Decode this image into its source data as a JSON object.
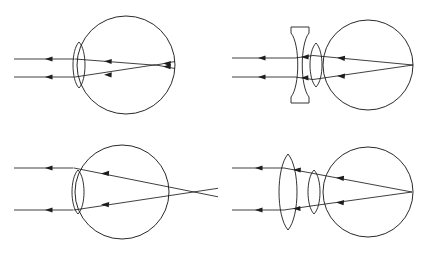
{
  "figure": {
    "background_color": "#ffffff",
    "stroke_color": "#1d1d1d",
    "width": 438,
    "height": 257,
    "panel_count": 4,
    "panel_layout": "2x2 grid"
  },
  "panels": [
    {
      "id": "panel-top-left",
      "position": "top-left",
      "name": "myopia-uncorrected",
      "condition": "Myopia (nearsighted), uncorrected",
      "spectacle_lens": "none",
      "focus_location": "in front of retina",
      "ray_count": 2,
      "eye": {
        "globe_center_x": 126,
        "globe_center_y": 65,
        "globe_radius": 49,
        "lens_center_x": 79,
        "lens_center_y": 65,
        "lens_half_height": 23,
        "lens_half_width": 7,
        "cornea_apex_x": 70
      },
      "rays": {
        "entry_x": 14,
        "upper_y": 59,
        "lower_y": 77,
        "arrow_x": 48,
        "crossing_x": 155,
        "crossing_y": 65,
        "terminus_x": 175
      }
    },
    {
      "id": "panel-top-right",
      "position": "top-right",
      "name": "myopia-corrected",
      "condition": "Myopia corrected by a diverging (biconcave) lens",
      "spectacle_lens": "biconcave",
      "focus_location": "on the retina",
      "ray_count": 2,
      "eye": {
        "globe_center_x": 368,
        "globe_center_y": 65,
        "globe_radius": 45,
        "lens_center_x": 316,
        "lens_center_y": 65,
        "lens_half_height": 22,
        "lens_half_width": 7,
        "cornea_apex_x": 307
      },
      "spec": {
        "center_x": 300,
        "center_y": 65,
        "half_height": 38,
        "waist_half_width": 4,
        "rim_half_width": 9
      },
      "rays": {
        "entry_x": 232,
        "upper_y": 58,
        "lower_y": 77,
        "arrow_x": 264,
        "focus_x": 413,
        "focus_y": 65
      }
    },
    {
      "id": "panel-bottom-left",
      "position": "bottom-left",
      "name": "hyperopia-uncorrected",
      "condition": "Hyperopia (farsighted), uncorrected",
      "spectacle_lens": "none",
      "focus_location": "behind the retina",
      "ray_count": 2,
      "eye": {
        "globe_center_x": 122,
        "globe_center_y": 192,
        "globe_radius": 47,
        "lens_center_x": 78,
        "lens_center_y": 192,
        "lens_half_height": 22,
        "lens_half_width": 7,
        "cornea_apex_x": 69
      },
      "rays": {
        "entry_x": 14,
        "upper_y": 168,
        "lower_y": 210,
        "arrow_x": 48,
        "crossing_x": 196,
        "crossing_y": 192,
        "terminus_x": 218
      }
    },
    {
      "id": "panel-bottom-right",
      "position": "bottom-right",
      "name": "hyperopia-corrected",
      "condition": "Hyperopia corrected by a converging (biconvex) lens",
      "spectacle_lens": "biconvex",
      "focus_location": "on the retina",
      "ray_count": 2,
      "eye": {
        "globe_center_x": 368,
        "globe_center_y": 192,
        "globe_radius": 45,
        "lens_center_x": 314,
        "lens_center_y": 192,
        "lens_half_height": 22,
        "lens_half_width": 7,
        "cornea_apex_x": 305
      },
      "spec": {
        "center_x": 288,
        "center_y": 192,
        "half_height": 38,
        "half_width": 10
      },
      "rays": {
        "entry_x": 232,
        "upper_y": 168,
        "lower_y": 210,
        "arrow_x": 262,
        "focus_x": 412,
        "focus_y": 192
      }
    }
  ],
  "legend": {
    "ray_direction": "left to right",
    "arrow_marker": "filled triangle",
    "line_style": "solid thin black"
  }
}
